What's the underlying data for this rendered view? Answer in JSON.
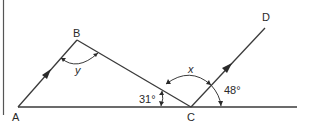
{
  "diagram": {
    "type": "geometry",
    "colors": {
      "line": "#3a3a3a",
      "text": "#2a2a2a",
      "background": "#ffffff"
    },
    "points": {
      "A": {
        "label": "A",
        "x": 18,
        "y": 107
      },
      "B": {
        "label": "B",
        "x": 77,
        "y": 40
      },
      "C": {
        "label": "C",
        "x": 191,
        "y": 107
      },
      "D": {
        "label": "D",
        "x": 266,
        "y": 26
      }
    },
    "angles": {
      "y": {
        "label": "y",
        "at": "B"
      },
      "x": {
        "label": "x",
        "at": "C",
        "between": "CB and CD"
      },
      "acb": {
        "label": "31°",
        "at": "C",
        "between": "CA and CB"
      },
      "dc_base": {
        "label": "48°",
        "at": "C",
        "between": "CD and baseline"
      }
    },
    "parallel_marks": [
      "AB",
      "CD"
    ]
  }
}
